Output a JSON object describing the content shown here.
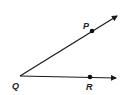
{
  "diagram": {
    "type": "angle",
    "colors": {
      "stroke": "#1a1a1a",
      "label": "#222222",
      "background": "#ffffff"
    },
    "vertex": {
      "label": "Q",
      "x": 20,
      "y": 76,
      "label_x": 12,
      "label_y": 89
    },
    "points": [
      {
        "label": "P",
        "x": 92,
        "y": 31,
        "label_x": 83,
        "label_y": 29
      },
      {
        "label": "R",
        "x": 90,
        "y": 77,
        "label_x": 86,
        "label_y": 90
      }
    ],
    "rays": [
      {
        "name": "ray-QP",
        "from": "Q",
        "through": "P",
        "tip_x": 117,
        "tip_y": 16
      },
      {
        "name": "ray-QR",
        "from": "Q",
        "through": "R",
        "tip_x": 116,
        "tip_y": 78
      }
    ]
  }
}
